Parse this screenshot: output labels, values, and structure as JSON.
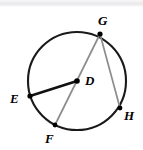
{
  "figure": {
    "type": "circle-geometry-diagram",
    "background_color": "#ffffff",
    "stroke_colors": {
      "circle": "#1a1a1a",
      "radius_de": "#111111",
      "chord_gh": "#8c8c8c",
      "diameter_gf": "#8c8c8c",
      "point_dot": "#000000"
    },
    "circle": {
      "center_label": "D",
      "center_x": 77,
      "center_y": 81,
      "radius": 49,
      "stroke_width": 2.1
    },
    "points": [
      {
        "label": "G",
        "x": 100,
        "y": 34,
        "label_x": 98,
        "label_y": 14,
        "on_circle": true
      },
      {
        "label": "E",
        "x": 30,
        "y": 96,
        "label_x": 10,
        "label_y": 92,
        "on_circle": true
      },
      {
        "label": "D",
        "x": 77,
        "y": 81,
        "label_x": 85,
        "label_y": 74,
        "on_circle": false
      },
      {
        "label": "F",
        "x": 55,
        "y": 125,
        "label_x": 45,
        "label_y": 132,
        "on_circle": true
      },
      {
        "label": "H",
        "x": 120,
        "y": 108,
        "label_x": 124,
        "label_y": 109,
        "on_circle": true
      }
    ],
    "segments": [
      {
        "name": "radius-D-E",
        "from": "D",
        "to": "E",
        "kind": "radius",
        "color": "#111111",
        "width": 2.6
      },
      {
        "name": "diameter-G-F",
        "from": "G",
        "to": "F",
        "kind": "diameter",
        "color": "#8c8c8c",
        "width": 1.7
      },
      {
        "name": "chord-G-H",
        "from": "G",
        "to": "H",
        "kind": "chord",
        "color": "#8c8c8c",
        "width": 1.7
      }
    ],
    "label_font_size": "13px"
  }
}
